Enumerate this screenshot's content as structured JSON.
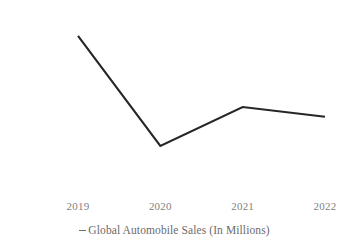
{
  "chart_data": {
    "type": "line",
    "title": "",
    "subtitle": "",
    "xlabel": "",
    "ylabel": "",
    "categories": [
      "2019",
      "2020",
      "2021",
      "2022"
    ],
    "series": [
      {
        "name": "Global Automobile Sales (In Millions)",
        "values": [
          91.3,
          77.7,
          82.5,
          81.3
        ],
        "color": "#262626"
      }
    ],
    "x_tick_labels": [
      "2019",
      "2020",
      "2021",
      "2022"
    ],
    "y_tick_labels": [
      "94",
      "92",
      "90",
      "88",
      "86",
      "84",
      "82",
      "80",
      "78",
      "76",
      "74",
      "72"
    ],
    "y_tick_values": [
      94,
      92,
      90,
      88,
      86,
      84,
      82,
      80,
      78,
      76,
      74,
      72
    ],
    "ylim": [
      72,
      94
    ],
    "y_step": 2,
    "grid": false,
    "axis_lines": false,
    "legend": {
      "position": "bottom",
      "marker": "line-dash-marker",
      "entries": [
        {
          "label": "Global Automobile Sales (In Millions)",
          "marker_color": "#6f6f6f"
        }
      ]
    },
    "colors": {
      "background": "#ffffff",
      "line": "#262626",
      "tick_label": "#7f7f7f",
      "legend_text": "#6b6b6b"
    }
  }
}
